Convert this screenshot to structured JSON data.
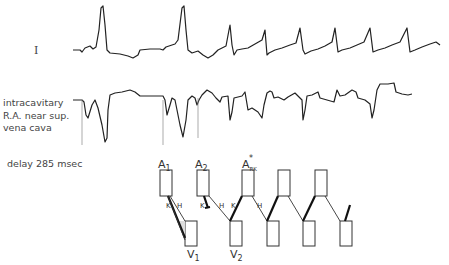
{
  "figure": {
    "lead_label": "I",
    "intracavitary_label": [
      "intracavitary",
      "R.A. near sup.",
      "vena cava"
    ],
    "delay_label": "delay  285 msec"
  },
  "ladder_diagram": {
    "atrial_labels": [
      "A1",
      "A2",
      "A*RK"
    ],
    "ventricular_labels": [
      "V1",
      "V2"
    ],
    "pathway_labels": {
      "K": "K",
      "H": "H"
    },
    "atrial_boxes": 5,
    "ventricular_boxes": 6
  },
  "labels": {
    "A1_main": "A",
    "A1_sub": "1",
    "A2_main": "A",
    "A2_sub": "2",
    "A3_main": "A",
    "A3_sub": "RK",
    "A3_star": "*",
    "V1_main": "V",
    "V1_sub": "1",
    "V2_main": "V",
    "V2_sub": "2",
    "K": "K",
    "H": "H"
  }
}
